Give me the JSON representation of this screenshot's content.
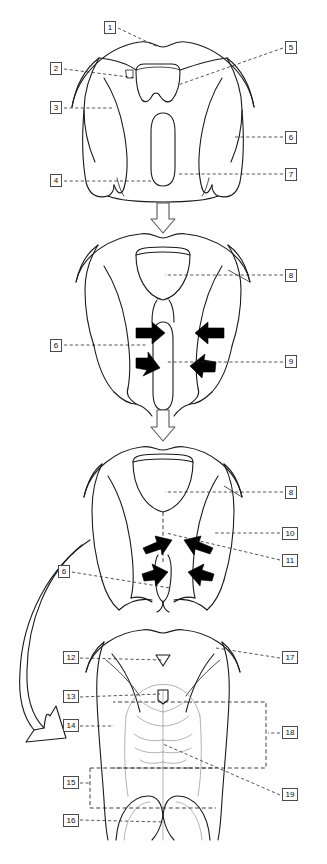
{
  "figure": {
    "panel_count": 4,
    "line_color": "#1a1a1a",
    "label_border_color": "#4a4a4a",
    "arrow_fill_color": "#000000",
    "background_color": "#ffffff"
  },
  "labels": [
    {
      "id": "1",
      "text": "1",
      "x": 104,
      "y": 21,
      "width": "lbl-w1",
      "panel": 1
    },
    {
      "id": "2",
      "text": "2",
      "x": 50,
      "y": 62,
      "width": "lbl-w1",
      "panel": 1
    },
    {
      "id": "3",
      "text": "3",
      "x": 50,
      "y": 101,
      "width": "lbl-w1",
      "panel": 1
    },
    {
      "id": "4",
      "text": "4",
      "x": 50,
      "y": 174,
      "width": "lbl-w1",
      "panel": 1
    },
    {
      "id": "5",
      "text": "5",
      "x": 285,
      "y": 41,
      "width": "lbl-w1",
      "panel": 1
    },
    {
      "id": "6a",
      "text": "6",
      "x": 285,
      "y": 131,
      "width": "lbl-w1",
      "panel": 1
    },
    {
      "id": "7",
      "text": "7",
      "x": 285,
      "y": 168,
      "width": "lbl-w1",
      "panel": 1
    },
    {
      "id": "8a",
      "text": "8",
      "x": 285,
      "y": 269,
      "width": "lbl-w1",
      "panel": 2
    },
    {
      "id": "6b",
      "text": "6",
      "x": 50,
      "y": 339,
      "width": "lbl-w1",
      "panel": 2
    },
    {
      "id": "9",
      "text": "9",
      "x": 285,
      "y": 355,
      "width": "lbl-w1",
      "panel": 2
    },
    {
      "id": "8b",
      "text": "8",
      "x": 285,
      "y": 486,
      "width": "lbl-w1",
      "panel": 3
    },
    {
      "id": "10",
      "text": "10",
      "x": 282,
      "y": 527,
      "width": "lbl-w2",
      "panel": 3
    },
    {
      "id": "11",
      "text": "11",
      "x": 282,
      "y": 554,
      "width": "lbl-w2",
      "panel": 3
    },
    {
      "id": "6c",
      "text": "6",
      "x": 58,
      "y": 565,
      "width": "lbl-w1",
      "panel": 3
    },
    {
      "id": "12",
      "text": "12",
      "x": 63,
      "y": 651,
      "width": "lbl-w2",
      "panel": 4
    },
    {
      "id": "13",
      "text": "13",
      "x": 63,
      "y": 690,
      "width": "lbl-w2",
      "panel": 4
    },
    {
      "id": "14",
      "text": "14",
      "x": 63,
      "y": 719,
      "width": "lbl-w2",
      "panel": 4
    },
    {
      "id": "15",
      "text": "15",
      "x": 63,
      "y": 776,
      "width": "lbl-w2",
      "panel": 4
    },
    {
      "id": "16",
      "text": "16",
      "x": 63,
      "y": 814,
      "width": "lbl-w2",
      "panel": 4
    },
    {
      "id": "17",
      "text": "17",
      "x": 282,
      "y": 651,
      "width": "lbl-w2",
      "panel": 4
    },
    {
      "id": "18",
      "text": "18",
      "x": 282,
      "y": 726,
      "width": "lbl-w2",
      "panel": 4
    },
    {
      "id": "19",
      "text": "19",
      "x": 282,
      "y": 788,
      "width": "lbl-w2",
      "panel": 4
    }
  ],
  "panels": [
    {
      "index": 1,
      "label_ids": [
        "1",
        "2",
        "3",
        "4",
        "5",
        "6a",
        "7"
      ]
    },
    {
      "index": 2,
      "label_ids": [
        "8a",
        "6b",
        "9"
      ]
    },
    {
      "index": 3,
      "label_ids": [
        "8b",
        "10",
        "11",
        "6c"
      ]
    },
    {
      "index": 4,
      "label_ids": [
        "12",
        "13",
        "14",
        "15",
        "16",
        "17",
        "18",
        "19"
      ]
    }
  ],
  "transition_arrows": [
    {
      "name": "panel1-to-panel2",
      "direction": "down"
    },
    {
      "name": "panel2-to-panel3",
      "direction": "down"
    },
    {
      "name": "panel3-to-panel4",
      "direction": "curved-left-down"
    }
  ]
}
